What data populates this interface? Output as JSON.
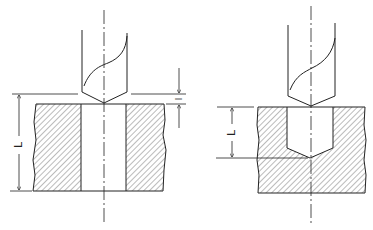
{
  "figures": [
    {
      "id": "through-hole",
      "labels": {
        "depth": "L",
        "approach": "l"
      }
    },
    {
      "id": "blind-hole",
      "labels": {
        "depth": "L"
      }
    }
  ],
  "colors": {
    "line": "#222222",
    "hatch": "#555555",
    "background": "#ffffff"
  }
}
